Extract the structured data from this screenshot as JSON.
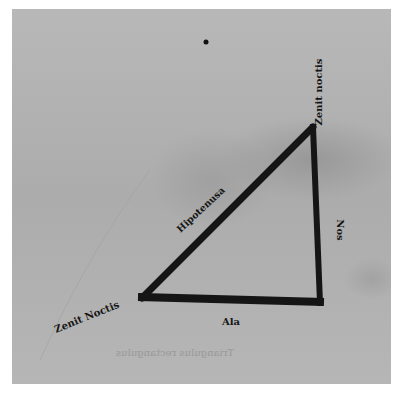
{
  "figure": {
    "type": "woodcut right-triangle diagram",
    "colors": {
      "paper": "#b3b3b3",
      "ink": "#151515",
      "background": "#ffffff"
    },
    "vertices": {
      "apex": [
        313,
        127
      ],
      "left": [
        140,
        298
      ],
      "right_angle": [
        320,
        302
      ]
    },
    "labels": {
      "apex_label": "Zenit noctis",
      "left_label": "Zenit Noctis",
      "hypotenuse_label": "Hipotenusa",
      "vertical_leg_label": "Nos",
      "base_label": "Ala"
    },
    "show_through_text": "Triangulus rectangulus"
  }
}
